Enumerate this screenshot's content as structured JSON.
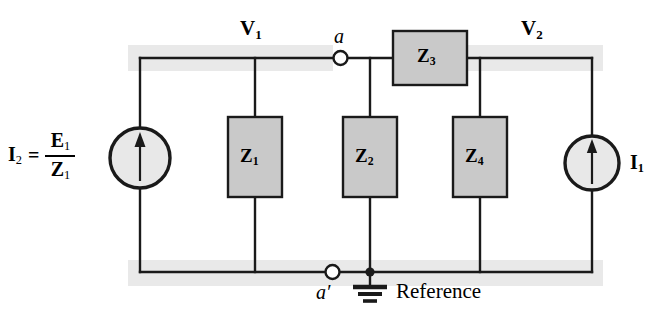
{
  "figure": {
    "type": "circuit-schematic",
    "background": "#ffffff",
    "wire_color": "#1a1a1a",
    "component_fill": "#c9c9c9",
    "component_stroke": "#1a1a1a",
    "highlight_band_color": "#e9e9e9"
  },
  "node_voltages": [
    {
      "name": "v1-label",
      "text": "V",
      "sub": "1"
    },
    {
      "name": "v2-label",
      "text": "V",
      "sub": "2"
    }
  ],
  "node_terminals": [
    {
      "name": "node-a",
      "label": "a",
      "style": "open-circle"
    },
    {
      "name": "node-a-prime",
      "label": "a′",
      "style": "open-circle"
    }
  ],
  "impedances": [
    {
      "id": "Z1",
      "symbol": "Z",
      "sub": "1",
      "orientation": "vertical"
    },
    {
      "id": "Z2",
      "symbol": "Z",
      "sub": "2",
      "orientation": "vertical"
    },
    {
      "id": "Z3",
      "symbol": "Z",
      "sub": "3",
      "orientation": "horizontal"
    },
    {
      "id": "Z4",
      "symbol": "Z",
      "sub": "4",
      "orientation": "vertical"
    }
  ],
  "sources": [
    {
      "id": "source-left",
      "kind": "current-source",
      "direction": "up",
      "label_parts": {
        "current": "I",
        "current_sub": "2",
        "equals": "=",
        "numerator": "E",
        "numerator_sub": "1",
        "denominator": "Z",
        "denominator_sub": "1"
      },
      "label_plain": "I2 = E1/Z1"
    },
    {
      "id": "source-right",
      "kind": "current-source",
      "direction": "up",
      "label_parts": {
        "current": "I",
        "current_sub": "1"
      },
      "label_plain": "I1"
    }
  ],
  "ground": {
    "name": "ground-symbol",
    "reference_label": "Reference"
  }
}
